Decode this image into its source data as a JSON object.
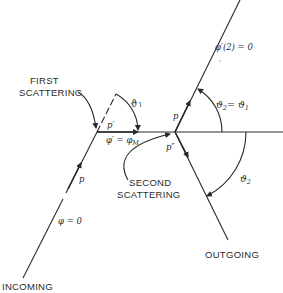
{
  "diagram": {
    "type": "double scattering geometry",
    "colors": {
      "line": "#2a2a2a",
      "background": "#ffffff"
    },
    "labels": {
      "first_scattering_line1": "FIRST",
      "first_scattering_line2": "SCATTERING",
      "second_scattering_line1": "SECOND",
      "second_scattering_line2": "SCATTERING",
      "incoming": "INCOMING",
      "outgoing": "OUTGOING",
      "phi_incoming": "φ = 0",
      "p_incoming": "p",
      "p_prime": "p′",
      "phi_prime": "φ′ = φ",
      "phi_prime_sub": "M",
      "theta1": "ϑ",
      "theta1_sub": "1",
      "p_out2": "p",
      "p_double_prime": "p″",
      "phi_prime2": "φ′(2) = 0",
      "theta2_eq_theta1": "ϑ",
      "theta2_eq_theta1_sub": "2",
      "theta2_eq_rhs": "= ϑ",
      "theta2_eq_rhs_sub": "1",
      "theta2": "ϑ",
      "theta2_sub": "2"
    }
  }
}
